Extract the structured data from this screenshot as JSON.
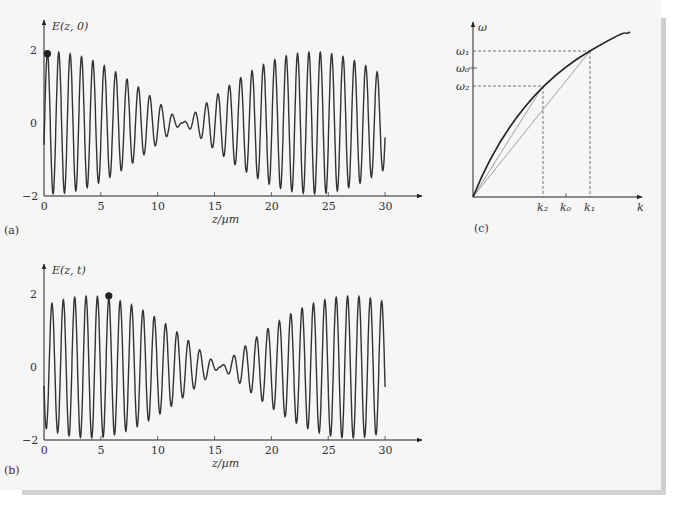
{
  "chart_data": [
    {
      "panel": "(a)",
      "type": "line",
      "ylabel": "E(z,0)",
      "xlabel": "z/µm",
      "xlim": [
        0,
        30
      ],
      "ylim": [
        -2,
        2
      ],
      "xticks": [
        "0",
        "5",
        "10",
        "15",
        "20",
        "25",
        "30"
      ],
      "yticks": [
        "-2",
        "0",
        "2"
      ],
      "description": "Beat wave: carrier period ~1 µm, envelope amplitude 2, node near z≈12.2 µm, maxima near z≈0 and z≈23.5 µm",
      "carrier_period_um": 1.0,
      "envelope_period_um": 23.0,
      "envelope_node_um": 12.2,
      "marker": {
        "z": 0.3,
        "E": 1.9
      }
    },
    {
      "panel": "(b)",
      "type": "line",
      "ylabel": "E(z,t)",
      "xlabel": "z/µm",
      "xlim": [
        0,
        30
      ],
      "ylim": [
        -2,
        2
      ],
      "xticks": [
        "0",
        "5",
        "10",
        "15",
        "20",
        "25",
        "30"
      ],
      "yticks": [
        "-2",
        "0",
        "2"
      ],
      "description": "Same beat wave at later time t: envelope shifted, node near z≈15.5 µm, maxima near z≈4 and z≈27 µm",
      "carrier_period_um": 1.0,
      "envelope_period_um": 23.0,
      "envelope_node_um": 15.5,
      "marker": {
        "z": 5.7,
        "E": 1.95
      }
    },
    {
      "panel": "(c)",
      "type": "line",
      "ylabel": "ω",
      "xlabel": "k",
      "description": "Concave dispersion curve ω(k) with secant lines from origin to (k2,ω2) and (k1,ω1); dashed projection lines",
      "xtick_labels": [
        "k2",
        "k0",
        "k1"
      ],
      "ytick_labels": [
        "ω1",
        "ω0",
        "ω2"
      ],
      "points": [
        {
          "name": "(k2, ω2)",
          "k": 0.44,
          "omega": 0.64
        },
        {
          "name": "(k1, ω1)",
          "k": 0.71,
          "omega": 0.85
        }
      ]
    }
  ],
  "labels": {
    "a_ylabel": "E(z, 0)",
    "b_ylabel": "E(z, t)",
    "xlabel": "z/µm",
    "panel_a": "(a)",
    "panel_b": "(b)",
    "panel_c": "(c)",
    "c_ylabel": "ω",
    "c_xlabel": "k",
    "ticks_x": [
      "0",
      "5",
      "10",
      "15",
      "20",
      "25",
      "30"
    ],
    "tick_y_top": "2",
    "tick_y_mid": "0",
    "tick_y_bot": "−2",
    "c_w1": "ω₁",
    "c_w0": "ω₀",
    "c_w2": "ω₂",
    "c_k2": "k₂",
    "c_k0": "k₀",
    "c_k1": "k₁"
  }
}
